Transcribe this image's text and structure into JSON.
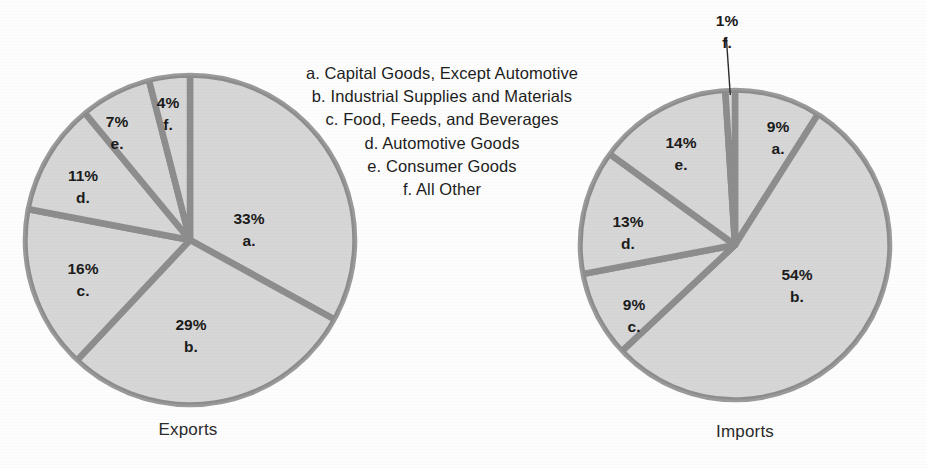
{
  "legend": {
    "items": [
      {
        "key": "a.",
        "label": "Capital Goods, Except Automotive",
        "text": "a. Capital Goods, Except Automotive"
      },
      {
        "key": "b.",
        "label": "Industrial Supplies and Materials",
        "text": "b. Industrial Supplies and Materials"
      },
      {
        "key": "c.",
        "label": "Food, Feeds, and Beverages",
        "text": "c. Food, Feeds, and Beverages"
      },
      {
        "key": "d.",
        "label": "Automotive Goods",
        "text": "d. Automotive Goods"
      },
      {
        "key": "e.",
        "label": "Consumer Goods",
        "text": "e. Consumer Goods"
      },
      {
        "key": "f.",
        "label": "All Other",
        "text": "f. All Other"
      }
    ]
  },
  "colors": {
    "background": "#fdfdfd",
    "slice_fill": "#d6d6d6",
    "divider": "#8d8d8d",
    "outline": "#9a9a9a",
    "text": "#1b1b1b"
  },
  "charts": [
    {
      "id": "exports",
      "caption": "Exports",
      "labels": [
        {
          "key": "a.",
          "pct": "33%"
        },
        {
          "key": "b.",
          "pct": "29%"
        },
        {
          "key": "c.",
          "pct": "16%"
        },
        {
          "key": "d.",
          "pct": "11%"
        },
        {
          "key": "e.",
          "pct": "7%"
        },
        {
          "key": "f.",
          "pct": "4%"
        }
      ]
    },
    {
      "id": "imports",
      "caption": "Imports",
      "labels": [
        {
          "key": "a.",
          "pct": "9%"
        },
        {
          "key": "b.",
          "pct": "54%"
        },
        {
          "key": "c.",
          "pct": "9%"
        },
        {
          "key": "d.",
          "pct": "13%"
        },
        {
          "key": "e.",
          "pct": "14%"
        },
        {
          "key": "f.",
          "pct": "1%"
        }
      ]
    }
  ],
  "chart_data": [
    {
      "type": "pie",
      "title": "Exports",
      "categories": [
        "a. Capital Goods, Except Automotive",
        "b. Industrial Supplies and Materials",
        "c. Food, Feeds, and Beverages",
        "d. Automotive Goods",
        "e. Consumer Goods",
        "f. All Other"
      ],
      "keys": [
        "a.",
        "b.",
        "c.",
        "d.",
        "e.",
        "f."
      ],
      "values": [
        33,
        29,
        16,
        11,
        7,
        4
      ],
      "value_labels": [
        "33%",
        "29%",
        "16%",
        "11%",
        "7%",
        "4%"
      ],
      "units": "percent",
      "start_angle_deg": 0,
      "direction": "clockwise",
      "legend_position": "center-between-charts",
      "grid": false
    },
    {
      "type": "pie",
      "title": "Imports",
      "categories": [
        "a. Capital Goods, Except Automotive",
        "b. Industrial Supplies and Materials",
        "c. Food, Feeds, and Beverages",
        "d. Automotive Goods",
        "e. Consumer Goods",
        "f. All Other"
      ],
      "keys": [
        "a.",
        "b.",
        "c.",
        "d.",
        "e.",
        "f."
      ],
      "values": [
        9,
        54,
        9,
        13,
        14,
        1
      ],
      "value_labels": [
        "9%",
        "54%",
        "9%",
        "13%",
        "14%",
        "1%"
      ],
      "units": "percent",
      "start_angle_deg": 0,
      "direction": "clockwise",
      "legend_position": "center-between-charts",
      "grid": false,
      "annotations": [
        {
          "text": "1% f.",
          "target_slice": "f.",
          "type": "leader-line"
        }
      ]
    }
  ]
}
